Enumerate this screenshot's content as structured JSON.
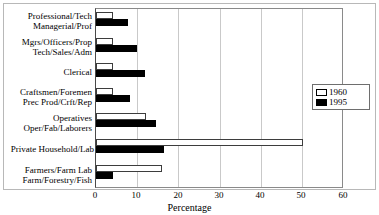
{
  "chart_data": {
    "type": "bar",
    "orientation": "horizontal",
    "title": "",
    "xlabel": "Percentage",
    "ylabel": "",
    "xlim": [
      0,
      60
    ],
    "xticks": [
      0,
      10,
      20,
      30,
      40,
      50,
      60
    ],
    "grid": true,
    "legend_position": "right",
    "categories": [
      "Professional/Tech\nManagerial/Prof",
      "Mgrs/Officers/Prop\nTech/Sales/Adm",
      "Clerical",
      "Craftsmen/Foremen\nPrec Prod/Crft/Rep",
      "Operatives\nOper/Fab/Laborers",
      "Private Household/Lab",
      "Farmers/Farm Lab\nFarm/Forestry/Fish"
    ],
    "category_lines": [
      [
        "Professional/Tech",
        "Managerial/Prof"
      ],
      [
        "Mgrs/Officers/Prop",
        "Tech/Sales/Adm"
      ],
      [
        "Clerical"
      ],
      [
        "Craftsmen/Foremen",
        "Prec Prod/Crft/Rep"
      ],
      [
        "Operatives",
        "Oper/Fab/Laborers"
      ],
      [
        "Private Household/Lab"
      ],
      [
        "Farmers/Farm Lab",
        "Farm/Forestry/Fish"
      ]
    ],
    "series": [
      {
        "name": "1960",
        "color": "#ffffff",
        "edge": "#000000",
        "values": [
          4.2,
          4.2,
          4.0,
          4.2,
          12.0,
          50.0,
          16.0
        ]
      },
      {
        "name": "1995",
        "color": "#000000",
        "edge": "#000000",
        "values": [
          7.8,
          10.0,
          11.8,
          8.2,
          14.5,
          16.5,
          4.2
        ]
      }
    ]
  },
  "legend": {
    "entries": [
      {
        "label": "1960"
      },
      {
        "label": "1995"
      }
    ]
  },
  "axis": {
    "x_title": "Percentage",
    "tick_labels": [
      "0",
      "10",
      "20",
      "30",
      "40",
      "50",
      "60"
    ]
  }
}
